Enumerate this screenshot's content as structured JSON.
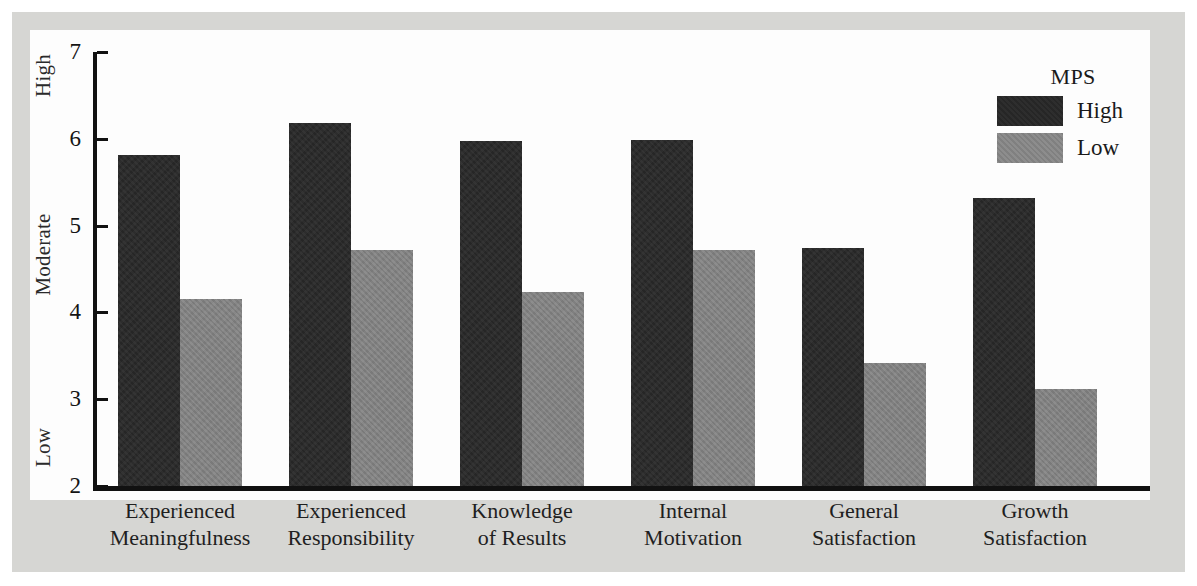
{
  "chart_data": {
    "type": "bar",
    "title": "",
    "subtitle": "",
    "xlabel": "",
    "ylabel": "",
    "ylim": [
      2,
      7
    ],
    "yticks": [
      "2",
      "3",
      "4",
      "5",
      "6",
      "7"
    ],
    "y_anchor_labels": [
      {
        "text": "Low",
        "value": 2.3
      },
      {
        "text": "Moderate",
        "value": 4.45
      },
      {
        "text": "High",
        "value": 6.65
      }
    ],
    "grid": false,
    "legend_position": "top-right",
    "legend_title": "MPS",
    "categories": [
      "Experienced Meaningfulness",
      "Experienced Responsibility",
      "Knowledge of Results",
      "Internal Motivation",
      "General Satisfaction",
      "Growth Satisfaction"
    ],
    "category_lines": [
      [
        "Experienced",
        "Meaningfulness"
      ],
      [
        "Experienced",
        "Responsibility"
      ],
      [
        "Knowledge",
        "of Results"
      ],
      [
        "Internal",
        "Motivation"
      ],
      [
        "General",
        "Satisfaction"
      ],
      [
        "Growth",
        "Satisfaction"
      ]
    ],
    "series": [
      {
        "name": "High",
        "color": "#262626",
        "values": [
          5.81,
          6.18,
          5.98,
          5.99,
          4.74,
          5.32
        ]
      },
      {
        "name": "Low",
        "color": "#808080",
        "values": [
          4.15,
          4.72,
          4.24,
          4.72,
          3.42,
          3.12
        ]
      }
    ]
  },
  "legend": {
    "title": "MPS",
    "entries": [
      {
        "label": "High",
        "color": "#262626"
      },
      {
        "label": "Low",
        "color": "#808080"
      }
    ]
  },
  "axes": {
    "y_ticks": [
      "7",
      "6",
      "5",
      "4",
      "3",
      "2"
    ],
    "y_anchors": [
      "High",
      "Moderate",
      "Low"
    ]
  },
  "colors": {
    "bar_high": "#262626",
    "bar_low": "#808080",
    "panel_background": "#d6d6d3",
    "plot_background": "#fdfdfd",
    "axis": "#111111",
    "text": "#1a1a1a"
  }
}
